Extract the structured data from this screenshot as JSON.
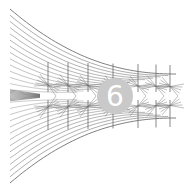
{
  "figure": {
    "background": "#ffffff",
    "line_color": "#6a6a6a",
    "bounds": {
      "left": 10,
      "right": 176,
      "top": 9,
      "bottom": 183,
      "center_y": 96,
      "right_half_height": 22
    },
    "curve_count": 14,
    "cross_columns": [
      48,
      68,
      88,
      113,
      138,
      156,
      170
    ]
  },
  "badge": {
    "label": "6",
    "cx": 115,
    "cy": 96,
    "radius": 18,
    "fill": "#c9c9c9",
    "text_color": "#ffffff",
    "font_size": 28
  }
}
